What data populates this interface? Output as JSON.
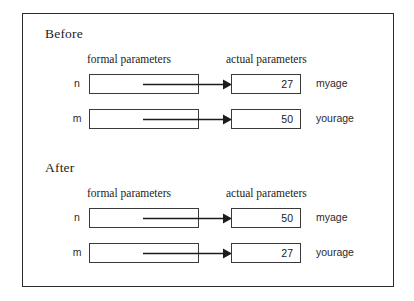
{
  "figure": {
    "sections": [
      {
        "id": "before",
        "title": "Before",
        "headers": {
          "formal": "formal parameters",
          "actual": "actual parameters"
        },
        "rows": [
          {
            "formal_name": "n",
            "value": "27",
            "actual_name": "myage"
          },
          {
            "formal_name": "m",
            "value": "50",
            "actual_name": "yourage"
          }
        ]
      },
      {
        "id": "after",
        "title": "After",
        "headers": {
          "formal": "formal parameters",
          "actual": "actual parameters"
        },
        "rows": [
          {
            "formal_name": "n",
            "value": "50",
            "actual_name": "myage"
          },
          {
            "formal_name": "m",
            "value": "27",
            "actual_name": "yourage"
          }
        ]
      }
    ],
    "colors": {
      "frame_border": "#2b2b2b",
      "box_border": "#3a3a3a",
      "arrow": "#1c1c1c",
      "text": "#1c1c1c",
      "background": "#ffffff"
    }
  }
}
